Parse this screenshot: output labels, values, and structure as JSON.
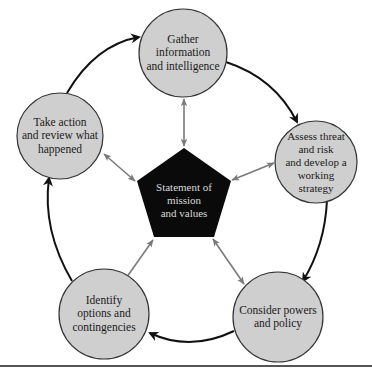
{
  "diagram": {
    "type": "cycle",
    "center": {
      "label": "Statement of\nmission\nand values"
    },
    "nodes": [
      {
        "id": "gather",
        "label": "Gather\ninformation\nand intelligence"
      },
      {
        "id": "assess",
        "label": "Assess threat\nand risk\nand develop a\nworking\nstrategy"
      },
      {
        "id": "consider",
        "label": "Consider powers\nand policy"
      },
      {
        "id": "identify",
        "label": "Identify\noptions and\ncontingencies"
      },
      {
        "id": "act",
        "label": "Take action\nand review what\nhappened"
      }
    ],
    "cycle_order": [
      "gather",
      "assess",
      "consider",
      "identify",
      "act",
      "gather"
    ],
    "colors": {
      "node_fill": "#cfcfcf",
      "node_stroke": "#333333",
      "center_fill": "#0a0a0a",
      "center_text": "#d9d9d9",
      "cycle_arrow": "#111111",
      "spoke_arrow": "#7a7a7a"
    }
  }
}
